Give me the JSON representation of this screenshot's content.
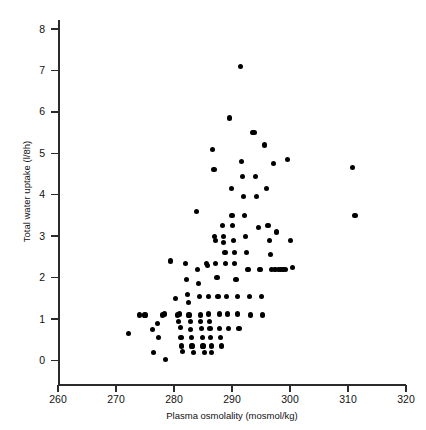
{
  "chart_data": {
    "type": "scatter",
    "title": "",
    "xlabel": "Plasma osmolality (mosmol/kg)",
    "ylabel": "Total water uptake (l/8h)",
    "xlim": [
      260,
      320
    ],
    "ylim": [
      0,
      8
    ],
    "xticks": [
      260,
      270,
      280,
      290,
      300,
      310,
      320
    ],
    "yticks": [
      0,
      1,
      2,
      3,
      4,
      5,
      6,
      7,
      8
    ],
    "grid": false,
    "legend": null,
    "marker": {
      "shape": "circle",
      "color": "#000000",
      "size_px": 5
    },
    "points": [
      [
        272.2,
        0.65
      ],
      [
        274.1,
        1.1
      ],
      [
        275.0,
        1.1
      ],
      [
        276.3,
        0.75
      ],
      [
        276.5,
        0.2
      ],
      [
        277.1,
        0.9
      ],
      [
        277.3,
        0.55
      ],
      [
        278.0,
        1.1
      ],
      [
        278.3,
        1.12
      ],
      [
        278.6,
        0.02
      ],
      [
        279.4,
        2.4
      ],
      [
        280.2,
        1.5
      ],
      [
        280.6,
        1.1
      ],
      [
        280.8,
        0.95
      ],
      [
        281.0,
        1.12
      ],
      [
        281.1,
        0.8
      ],
      [
        281.2,
        0.55
      ],
      [
        281.3,
        0.35
      ],
      [
        281.5,
        0.22
      ],
      [
        282.0,
        2.35
      ],
      [
        282.1,
        1.95
      ],
      [
        282.3,
        1.6
      ],
      [
        282.5,
        1.4
      ],
      [
        282.6,
        1.1
      ],
      [
        282.8,
        0.95
      ],
      [
        282.9,
        0.75
      ],
      [
        283.0,
        0.55
      ],
      [
        283.1,
        0.35
      ],
      [
        283.3,
        0.2
      ],
      [
        283.9,
        3.6
      ],
      [
        284.1,
        2.2
      ],
      [
        284.2,
        1.85
      ],
      [
        284.4,
        1.55
      ],
      [
        284.5,
        1.1
      ],
      [
        284.6,
        0.95
      ],
      [
        284.8,
        0.78
      ],
      [
        284.9,
        0.55
      ],
      [
        285.0,
        0.35
      ],
      [
        285.2,
        0.2
      ],
      [
        285.6,
        2.35
      ],
      [
        285.8,
        2.3
      ],
      [
        285.9,
        1.55
      ],
      [
        286.0,
        1.12
      ],
      [
        286.1,
        0.95
      ],
      [
        286.2,
        0.78
      ],
      [
        286.3,
        0.55
      ],
      [
        286.4,
        0.35
      ],
      [
        286.5,
        0.2
      ],
      [
        286.7,
        5.1
      ],
      [
        286.9,
        4.6
      ],
      [
        287.0,
        3.0
      ],
      [
        287.1,
        2.9
      ],
      [
        287.2,
        2.35
      ],
      [
        287.4,
        2.0
      ],
      [
        287.6,
        1.55
      ],
      [
        287.8,
        1.12
      ],
      [
        287.9,
        0.78
      ],
      [
        288.0,
        0.55
      ],
      [
        288.2,
        0.35
      ],
      [
        288.4,
        3.25
      ],
      [
        288.5,
        3.0
      ],
      [
        288.6,
        2.85
      ],
      [
        288.8,
        2.6
      ],
      [
        288.9,
        2.35
      ],
      [
        289.0,
        1.55
      ],
      [
        289.2,
        1.12
      ],
      [
        289.4,
        0.78
      ],
      [
        289.6,
        5.85
      ],
      [
        289.9,
        4.15
      ],
      [
        290.0,
        3.5
      ],
      [
        290.1,
        3.25
      ],
      [
        290.3,
        2.9
      ],
      [
        290.4,
        2.6
      ],
      [
        290.5,
        2.35
      ],
      [
        290.7,
        1.95
      ],
      [
        290.9,
        1.55
      ],
      [
        291.0,
        1.12
      ],
      [
        291.2,
        0.78
      ],
      [
        291.4,
        7.1
      ],
      [
        291.6,
        4.8
      ],
      [
        291.8,
        4.45
      ],
      [
        292.0,
        3.95
      ],
      [
        292.2,
        3.5
      ],
      [
        292.3,
        3.0
      ],
      [
        292.5,
        2.6
      ],
      [
        292.7,
        2.2
      ],
      [
        292.9,
        2.2
      ],
      [
        293.0,
        1.55
      ],
      [
        293.2,
        1.1
      ],
      [
        293.5,
        5.5
      ],
      [
        293.8,
        5.5
      ],
      [
        294.0,
        4.45
      ],
      [
        294.2,
        3.95
      ],
      [
        294.5,
        3.2
      ],
      [
        294.7,
        2.2
      ],
      [
        294.9,
        2.2
      ],
      [
        295.1,
        1.55
      ],
      [
        295.3,
        1.1
      ],
      [
        295.6,
        5.2
      ],
      [
        295.9,
        4.15
      ],
      [
        296.2,
        3.25
      ],
      [
        296.4,
        2.9
      ],
      [
        296.6,
        2.55
      ],
      [
        296.8,
        2.2
      ],
      [
        297.1,
        4.75
      ],
      [
        297.4,
        2.2
      ],
      [
        297.7,
        3.1
      ],
      [
        298.0,
        2.2
      ],
      [
        298.4,
        2.2
      ],
      [
        298.8,
        2.2
      ],
      [
        299.2,
        2.2
      ],
      [
        299.6,
        4.85
      ],
      [
        300.1,
        2.9
      ],
      [
        300.4,
        2.25
      ],
      [
        310.8,
        4.65
      ],
      [
        311.2,
        3.5
      ]
    ]
  },
  "axes": {
    "x_tick_labels": [
      "260",
      "270",
      "280",
      "290",
      "300",
      "310",
      "320"
    ],
    "y_tick_labels": [
      "0",
      "1",
      "2",
      "3",
      "4",
      "5",
      "6",
      "7",
      "8"
    ],
    "x_axis_title": "Plasma osmolality (mosmol/kg)",
    "y_axis_title": "Total water uptake (l/8h)"
  }
}
